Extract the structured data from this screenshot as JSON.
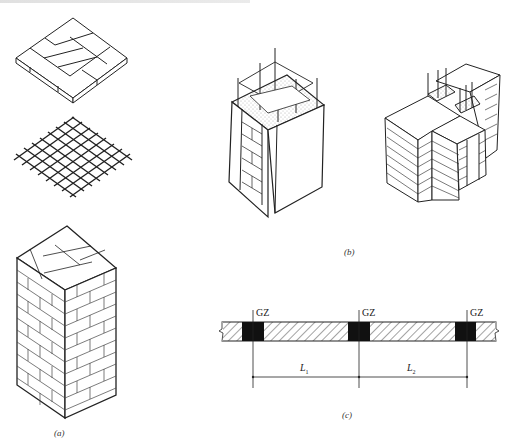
{
  "figure": {
    "panels": [
      {
        "id": "a",
        "caption": "(a)",
        "description": "brick pier with mesh reinforcement layers: brick course, steel mesh, and full brick column"
      },
      {
        "id": "b",
        "caption": "(b)",
        "description": "constructional columns with vertical rebar at wall corner and T-junction"
      },
      {
        "id": "c",
        "caption": "(c)",
        "description": "wall plan with constructional columns GZ and spacing L1, L2"
      }
    ],
    "plan": {
      "column_labels": [
        "GZ",
        "GZ",
        "GZ"
      ],
      "dimensions": [
        {
          "label": "L",
          "sub": "1"
        },
        {
          "label": "L",
          "sub": "2"
        }
      ]
    }
  }
}
